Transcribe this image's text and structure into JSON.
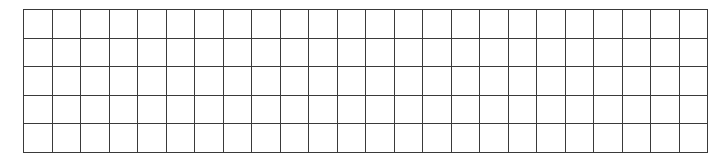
{
  "grid": {
    "columns": 24,
    "rows": 5,
    "line_color": "#3a3a3a",
    "background_color": "#ffffff",
    "cells_filled": []
  }
}
